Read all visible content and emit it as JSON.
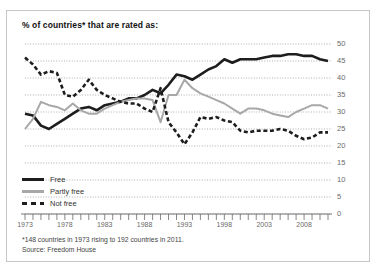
{
  "title": "% of countries* that are rated as:",
  "footnotes": {
    "line1": "*148 countries in 1973 rising to 192 countries in 2011.",
    "line2": "Source: Freedom House"
  },
  "legend": [
    {
      "label": "Free",
      "key": "free",
      "color": "#1d1d1d",
      "style": "solid-thick"
    },
    {
      "label": "Partly free",
      "key": "partly_free",
      "color": "#a8a8a8",
      "style": "solid"
    },
    {
      "label": "Not free",
      "key": "not_free",
      "color": "#1d1d1d",
      "style": "dashed"
    }
  ],
  "colors": {
    "free": "#1d1d1d",
    "partly_free": "#a8a8a8",
    "not_free": "#1d1d1d",
    "gridline": "#9a9a9a",
    "axis": "#6a6a6a",
    "border": "#c8c8c8",
    "label": "#6a6a6a"
  },
  "chart_data": {
    "type": "line",
    "title": "% of countries* that are rated as:",
    "xlabel": "",
    "ylabel": "",
    "ylim": [
      0,
      50
    ],
    "xlim": [
      1973,
      2011
    ],
    "yticks": [
      0,
      5,
      10,
      15,
      20,
      25,
      30,
      35,
      40,
      45,
      50
    ],
    "ytick_labels": [
      "0",
      "5",
      "10",
      "15",
      "20",
      "25",
      "30",
      "35",
      "40",
      "45",
      "50"
    ],
    "y_axis_position": "right",
    "xticks": [
      1973,
      1978,
      1983,
      1988,
      1993,
      1998,
      2003,
      2008
    ],
    "xtick_labels": [
      "1973",
      "1978",
      "1983",
      "1988",
      "1993",
      "1998",
      "2003",
      "2008"
    ],
    "grid": true,
    "grid_style": "dotted-horizontal",
    "legend_position": "bottom-left",
    "x": [
      1973,
      1974,
      1975,
      1976,
      1977,
      1978,
      1979,
      1980,
      1981,
      1982,
      1983,
      1984,
      1985,
      1986,
      1987,
      1988,
      1989,
      1990,
      1991,
      1992,
      1993,
      1994,
      1995,
      1996,
      1997,
      1998,
      1999,
      2000,
      2001,
      2002,
      2003,
      2004,
      2005,
      2006,
      2007,
      2008,
      2009,
      2010,
      2011
    ],
    "series": [
      {
        "name": "Free",
        "color": "#1d1d1d",
        "values": [
          29.5,
          29,
          26,
          25,
          26.5,
          28,
          29.5,
          31,
          31.5,
          30.5,
          32,
          32.5,
          33,
          34,
          34,
          35,
          36.5,
          35.5,
          38,
          41,
          40.5,
          39.5,
          41,
          42.5,
          43.5,
          45.5,
          44.5,
          45.5,
          45.5,
          45.5,
          46,
          46.5,
          46.5,
          47,
          47,
          46.5,
          46.5,
          45.5,
          45
        ]
      },
      {
        "name": "Partly free",
        "color": "#a8a8a8",
        "values": [
          25,
          28,
          33,
          32,
          31.5,
          30.5,
          32.5,
          30.5,
          29.5,
          29.5,
          31,
          32,
          33,
          33.5,
          34,
          34,
          33.5,
          27,
          35,
          35,
          39.5,
          37,
          35.5,
          34.5,
          33.5,
          32.5,
          31,
          29.5,
          31,
          31,
          30.5,
          29.5,
          29,
          28.5,
          30,
          31,
          32,
          32,
          31
        ]
      },
      {
        "name": "Not free",
        "color": "#1d1d1d",
        "values": [
          46,
          44,
          41,
          42,
          41.5,
          35,
          34.5,
          36.5,
          39.5,
          36.5,
          35,
          34,
          33,
          32.5,
          32.5,
          31,
          30,
          37,
          27,
          24,
          20.5,
          24,
          28.5,
          28,
          28.5,
          27.5,
          27,
          24.5,
          24,
          24.5,
          24.5,
          24.5,
          25,
          24.5,
          23,
          22,
          22.5,
          24,
          24
        ]
      }
    ]
  }
}
